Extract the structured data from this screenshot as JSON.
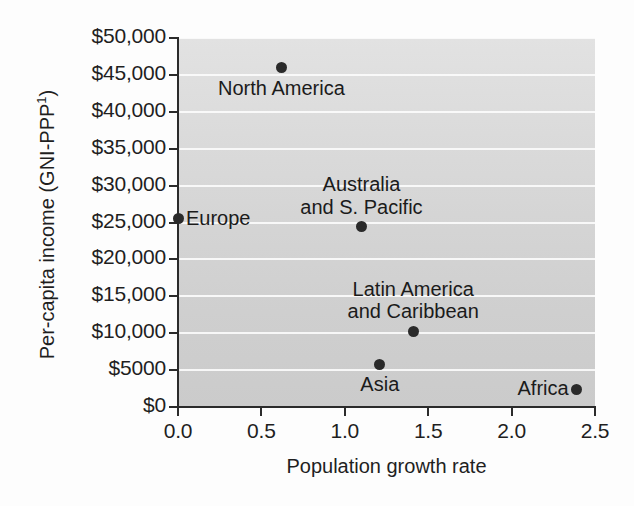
{
  "chart_data": {
    "type": "scatter",
    "title": "",
    "xlabel": "Population growth rate",
    "ylabel": "Per-capita income (GNI-PPP¹)",
    "ylabel_base": "Per-capita income (GNI-PPP",
    "ylabel_sup": "1",
    "ylabel_close": ")",
    "xlim": [
      0.0,
      2.5
    ],
    "ylim": [
      0,
      50000
    ],
    "grid": true,
    "legend": "none",
    "xticks": [
      0.0,
      0.5,
      1.0,
      1.5,
      2.0,
      2.5
    ],
    "xtick_labels": [
      "0.0",
      "0.5",
      "1.0",
      "1.5",
      "2.0",
      "2.5"
    ],
    "yticks": [
      0,
      5000,
      10000,
      15000,
      20000,
      25000,
      30000,
      35000,
      40000,
      45000,
      50000
    ],
    "ytick_labels": [
      "$0",
      "$5000",
      "$10,000",
      "$15,000",
      "$20,000",
      "$25,000",
      "$30,000",
      "$35,000",
      "$40,000",
      "$45,000",
      "$50,000"
    ],
    "points": [
      {
        "label": "North America",
        "x": 0.62,
        "y": 46000,
        "label_lines": [
          "North America"
        ],
        "label_pos": "below"
      },
      {
        "label": "Europe",
        "x": 0.0,
        "y": 25500,
        "label_lines": [
          "Europe"
        ],
        "label_pos": "right"
      },
      {
        "label": "Australia and S. Pacific",
        "x": 1.1,
        "y": 24400,
        "label_lines": [
          "Australia",
          "and S. Pacific"
        ],
        "label_pos": "above"
      },
      {
        "label": "Latin America and Caribbean",
        "x": 1.41,
        "y": 10200,
        "label_lines": [
          "Latin America",
          "and Caribbean"
        ],
        "label_pos": "above"
      },
      {
        "label": "Asia",
        "x": 1.21,
        "y": 5800,
        "label_lines": [
          "Asia"
        ],
        "label_pos": "below"
      },
      {
        "label": "Africa",
        "x": 2.39,
        "y": 2400,
        "label_lines": [
          "Africa"
        ],
        "label_pos": "left"
      }
    ],
    "colors": {
      "point": "#2a2a2a",
      "plot_background": "#d7d7d7",
      "gridline": "#fbfbfb",
      "axis": "#2b2b2b",
      "text": "#1f1f1f",
      "figure_background": "#fdfdfd"
    }
  }
}
